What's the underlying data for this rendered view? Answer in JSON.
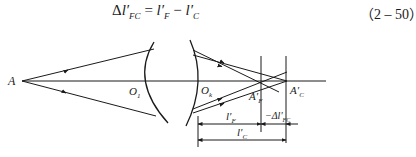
{
  "equation": {
    "lhs_delta": "Δ",
    "lhs_var": "l′",
    "lhs_sub": "FC",
    "eq": " = ",
    "t1_var": "l′",
    "t1_sub": "F",
    "minus": " − ",
    "t2_var": "l′",
    "t2_sub": "C",
    "number": "（2 – 50）"
  },
  "diagram": {
    "labels": {
      "object_point": "A",
      "vertex1": "O",
      "vertex1_sub": "1",
      "vertex2": "O",
      "vertex2_sub": "k",
      "image_F": "A′",
      "image_F_sub": "F",
      "image_C": "A′",
      "image_C_sub": "C",
      "dim_lF": "l′",
      "dim_lF_sub": "F",
      "dim_delta": "−Δl′",
      "dim_delta_sub": "FC",
      "dim_lC": "l′",
      "dim_lC_sub": "C"
    },
    "colors": {
      "line": "#1a1a1a",
      "background": "#ffffff"
    }
  }
}
